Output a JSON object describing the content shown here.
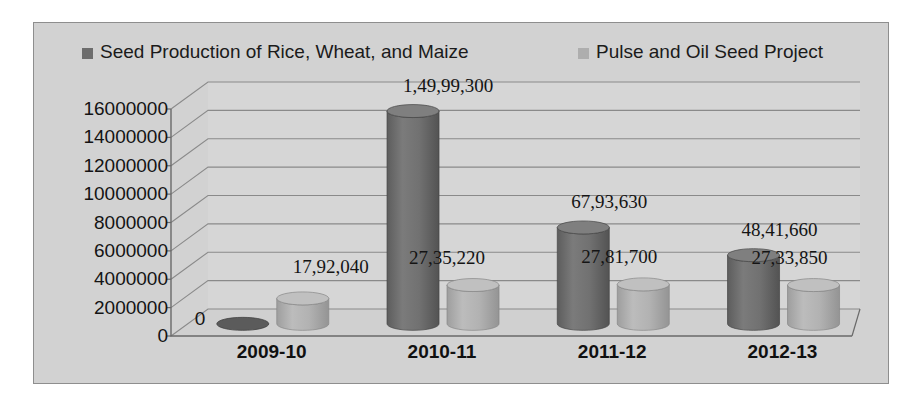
{
  "chart_data": {
    "type": "bar",
    "title": "",
    "subtitle": "",
    "xlabel": "",
    "ylabel": "",
    "categories": [
      "2009-10",
      "2010-11",
      "2011-12",
      "2012-13"
    ],
    "ylim": [
      0,
      16000000
    ],
    "ytick_values": [
      16000000,
      14000000,
      12000000,
      10000000,
      8000000,
      6000000,
      4000000,
      2000000,
      0
    ],
    "ytick_labels": [
      "16000000",
      "14000000",
      "12000000",
      "10000000",
      "8000000",
      "6000000",
      "4000000",
      "2000000",
      "0"
    ],
    "grid": true,
    "legend_position": "top",
    "style": "3d-cylinder",
    "series": [
      {
        "name": "Seed Production of Rice, Wheat, and Maize",
        "color": "#6d6d6d",
        "values": [
          0,
          14999300,
          6793630,
          4841660
        ],
        "data_labels": [
          "0",
          "1,49,99,300",
          "67,93,630",
          "48,41,660"
        ]
      },
      {
        "name": "Pulse and Oil Seed Project",
        "color": "#aeaeae",
        "values": [
          1792040,
          2735220,
          2781700,
          2733850
        ],
        "data_labels": [
          "17,92,040",
          "27,35,220",
          "27,81,700",
          "27,33,850"
        ]
      }
    ]
  },
  "legend": {
    "items": [
      {
        "label": "Seed Production of Rice, Wheat, and Maize",
        "color": "#6d6d6d"
      },
      {
        "label": "Pulse and Oil Seed Project",
        "color": "#aeaeae"
      }
    ]
  },
  "colors": {
    "plot_background": "#d2d2d2",
    "frame_border": "#8e8e8e",
    "gridline": "#8a8a8a",
    "axis": "#6a6a6a",
    "series_1": "#6d6d6d",
    "series_2": "#aeaeae",
    "text": "#141414"
  }
}
